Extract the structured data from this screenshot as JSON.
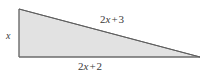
{
  "figure": {
    "type": "right-triangle-diagram",
    "background_color": "#ffffff",
    "fill_color": "#e2e2e2",
    "stroke_color": "#6e6e6e",
    "text_color": "#3a3a3a",
    "vertices": {
      "top_left": [
        19,
        9
      ],
      "bottom_left": [
        19,
        57
      ],
      "bottom_right": [
        200,
        57
      ]
    }
  },
  "labels": {
    "leg": {
      "full_text": "x",
      "coefficient": "",
      "variable": "x",
      "operator": "",
      "constant": ""
    },
    "hypotenuse": {
      "full_text": "2x + 3",
      "coefficient": "2",
      "variable": "x",
      "operator": "+",
      "constant": "3"
    },
    "base": {
      "full_text": "2x + 2",
      "coefficient": "2",
      "variable": "x",
      "operator": "+",
      "constant": "2"
    }
  }
}
